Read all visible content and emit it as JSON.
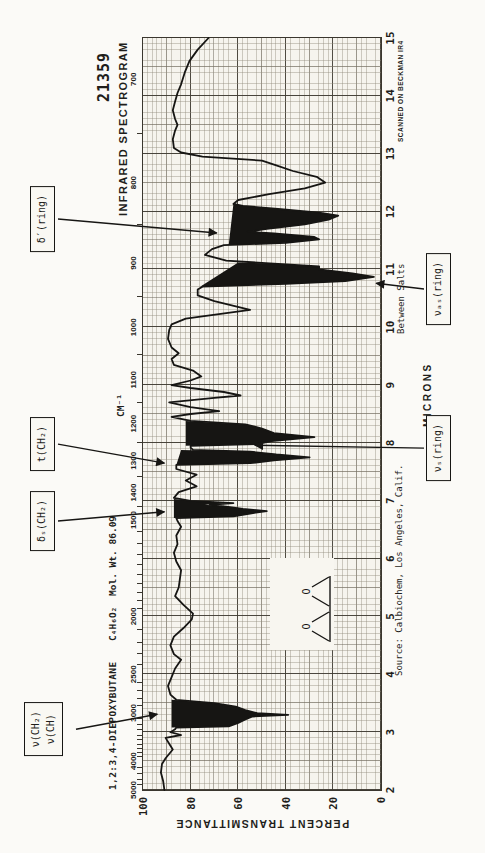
{
  "meta": {
    "catalog_number": "21359",
    "title": "INFRARED SPECTROGRAM",
    "compound": "1,2:3,4-DIEPOXYBUTANE",
    "formula": "C₄H₆O₂",
    "mol_wt": "Mol. Wt. 86.09",
    "source": "Source: Calbiochem, Los Angeles, Calif.",
    "sample_note": "Between Salts",
    "scanner": "SCANNED ON BECKMAN IR4"
  },
  "structure": {
    "o1": "O",
    "o2": "O"
  },
  "colors": {
    "paper": "#f6f4ee",
    "grid_minor": "#918b7c",
    "grid_major": "#3a362e",
    "ink": "#161513"
  },
  "chart_data": {
    "type": "line",
    "title": "INFRARED SPECTROGRAM",
    "xlabel_bottom": "MICRONS",
    "xlabel_top": "CM⁻¹",
    "ylabel": "PERCENT TRANSMITTANCE",
    "x_range_microns": [
      2,
      15
    ],
    "y_range_percent": [
      0,
      100
    ],
    "micron_ticks": [
      2,
      3,
      4,
      5,
      6,
      7,
      8,
      9,
      10,
      11,
      12,
      13,
      14,
      15
    ],
    "cm_ticks": [
      5000,
      4000,
      3000,
      2500,
      2000,
      1500,
      1400,
      1300,
      1200,
      1100,
      1000,
      900,
      800,
      700
    ],
    "cm_minor_ticks": [
      4800,
      4600,
      4400,
      4200,
      3900,
      3800,
      3700,
      3600,
      3500,
      3400,
      3300,
      3200,
      3100,
      2900,
      2800,
      2700,
      2600,
      2400,
      2300,
      2200,
      2100,
      1950,
      1900,
      1850,
      1800,
      1750,
      1700,
      1650,
      1600,
      1550,
      1450,
      1350,
      1250,
      1150,
      1050,
      950,
      850,
      750
    ],
    "t_ticks": [
      100,
      80,
      60,
      40,
      20,
      0
    ],
    "series": [
      [
        2.0,
        91
      ],
      [
        2.15,
        91.5
      ],
      [
        2.3,
        92.5
      ],
      [
        2.45,
        92
      ],
      [
        2.55,
        90.5
      ],
      [
        2.7,
        87.5
      ],
      [
        2.8,
        89
      ],
      [
        2.9,
        90.5
      ],
      [
        2.95,
        84
      ],
      [
        3.0,
        88.5
      ],
      [
        3.05,
        86.5
      ],
      [
        3.08,
        86
      ],
      [
        3.1,
        64
      ],
      [
        3.16,
        60
      ],
      [
        3.22,
        57
      ],
      [
        3.27,
        54
      ],
      [
        3.3,
        39
      ],
      [
        3.33,
        52
      ],
      [
        3.38,
        57
      ],
      [
        3.44,
        61
      ],
      [
        3.5,
        70
      ],
      [
        3.56,
        86
      ],
      [
        3.65,
        88.5
      ],
      [
        3.8,
        89.5
      ],
      [
        3.95,
        88
      ],
      [
        4.1,
        86.5
      ],
      [
        4.25,
        84
      ],
      [
        4.35,
        87
      ],
      [
        4.5,
        88.5
      ],
      [
        4.65,
        87
      ],
      [
        4.8,
        83
      ],
      [
        4.95,
        79.5
      ],
      [
        5.05,
        79
      ],
      [
        5.2,
        83
      ],
      [
        5.35,
        86.5
      ],
      [
        5.5,
        85
      ],
      [
        5.65,
        84.5
      ],
      [
        5.8,
        84
      ],
      [
        5.95,
        86
      ],
      [
        6.1,
        87
      ],
      [
        6.25,
        85.5
      ],
      [
        6.4,
        86
      ],
      [
        6.55,
        84
      ],
      [
        6.65,
        85.5
      ],
      [
        6.7,
        86
      ],
      [
        6.73,
        62
      ],
      [
        6.78,
        55
      ],
      [
        6.82,
        48
      ],
      [
        6.86,
        58
      ],
      [
        6.9,
        65
      ],
      [
        6.93,
        72
      ],
      [
        6.96,
        62
      ],
      [
        7.0,
        80
      ],
      [
        7.05,
        87
      ],
      [
        7.15,
        85
      ],
      [
        7.25,
        77.5
      ],
      [
        7.35,
        82
      ],
      [
        7.45,
        77.5
      ],
      [
        7.55,
        86
      ],
      [
        7.62,
        86
      ],
      [
        7.65,
        55
      ],
      [
        7.7,
        45
      ],
      [
        7.75,
        30
      ],
      [
        7.8,
        44
      ],
      [
        7.85,
        55
      ],
      [
        7.88,
        79
      ],
      [
        7.92,
        80
      ],
      [
        7.95,
        80
      ],
      [
        7.98,
        52
      ],
      [
        8.03,
        46
      ],
      [
        8.1,
        28
      ],
      [
        8.17,
        45
      ],
      [
        8.25,
        50
      ],
      [
        8.32,
        57
      ],
      [
        8.38,
        80
      ],
      [
        8.45,
        88
      ],
      [
        8.5,
        80
      ],
      [
        8.55,
        68
      ],
      [
        8.62,
        80
      ],
      [
        8.7,
        89
      ],
      [
        8.78,
        70
      ],
      [
        8.82,
        59
      ],
      [
        8.88,
        66
      ],
      [
        8.95,
        80
      ],
      [
        9.0,
        88
      ],
      [
        9.08,
        80
      ],
      [
        9.15,
        75.5
      ],
      [
        9.25,
        79
      ],
      [
        9.35,
        87
      ],
      [
        9.45,
        88
      ],
      [
        9.55,
        85
      ],
      [
        9.65,
        88
      ],
      [
        9.8,
        89.5
      ],
      [
        9.95,
        89
      ],
      [
        10.05,
        88
      ],
      [
        10.15,
        82
      ],
      [
        10.3,
        55
      ],
      [
        10.45,
        70
      ],
      [
        10.55,
        77
      ],
      [
        10.65,
        77
      ],
      [
        10.7,
        75
      ],
      [
        10.75,
        40
      ],
      [
        10.8,
        15
      ],
      [
        10.87,
        3
      ],
      [
        10.93,
        12
      ],
      [
        11.0,
        26
      ],
      [
        11.05,
        26
      ],
      [
        11.1,
        45
      ],
      [
        11.15,
        65
      ],
      [
        11.25,
        74
      ],
      [
        11.35,
        71
      ],
      [
        11.42,
        66
      ],
      [
        11.46,
        40
      ],
      [
        11.52,
        26
      ],
      [
        11.56,
        28
      ],
      [
        11.62,
        45
      ],
      [
        11.65,
        56
      ],
      [
        11.7,
        48
      ],
      [
        11.78,
        32
      ],
      [
        11.86,
        22
      ],
      [
        11.93,
        18
      ],
      [
        11.98,
        26
      ],
      [
        12.04,
        42
      ],
      [
        12.1,
        58
      ],
      [
        12.13,
        62
      ],
      [
        12.2,
        60
      ],
      [
        12.3,
        47
      ],
      [
        12.4,
        32
      ],
      [
        12.5,
        23.5
      ],
      [
        12.6,
        27
      ],
      [
        12.7,
        37
      ],
      [
        12.8,
        44
      ],
      [
        12.88,
        50
      ],
      [
        12.95,
        75
      ],
      [
        13.02,
        84
      ],
      [
        13.1,
        87
      ],
      [
        13.25,
        87.5
      ],
      [
        13.4,
        86.5
      ],
      [
        13.5,
        85.5
      ],
      [
        13.6,
        86.5
      ],
      [
        13.75,
        87.5
      ],
      [
        13.9,
        86.5
      ],
      [
        14.05,
        85.5
      ],
      [
        14.2,
        84
      ],
      [
        14.4,
        82.5
      ],
      [
        14.6,
        80.5
      ],
      [
        14.8,
        77
      ],
      [
        15.0,
        72.5
      ]
    ],
    "filled_bands": [
      [
        [
          3.08,
          88
        ],
        [
          3.1,
          64
        ],
        [
          3.16,
          60
        ],
        [
          3.22,
          57
        ],
        [
          3.27,
          54
        ],
        [
          3.3,
          39
        ],
        [
          3.33,
          52
        ],
        [
          3.38,
          57
        ],
        [
          3.44,
          61
        ],
        [
          3.5,
          70
        ],
        [
          3.56,
          88
        ]
      ],
      [
        [
          6.7,
          87
        ],
        [
          6.73,
          62
        ],
        [
          6.78,
          55
        ],
        [
          6.82,
          48
        ],
        [
          6.86,
          58
        ],
        [
          6.9,
          65
        ],
        [
          6.93,
          74
        ],
        [
          6.96,
          62
        ],
        [
          7.0,
          80
        ],
        [
          7.03,
          87
        ]
      ],
      [
        [
          7.62,
          86
        ],
        [
          7.65,
          55
        ],
        [
          7.7,
          45
        ],
        [
          7.75,
          30
        ],
        [
          7.8,
          44
        ],
        [
          7.85,
          55
        ],
        [
          7.88,
          84
        ]
      ],
      [
        [
          7.95,
          82
        ],
        [
          7.98,
          52
        ],
        [
          8.03,
          46
        ],
        [
          8.1,
          28
        ],
        [
          8.17,
          45
        ],
        [
          8.25,
          50
        ],
        [
          8.32,
          57
        ],
        [
          8.38,
          82
        ]
      ],
      [
        [
          10.7,
          76
        ],
        [
          10.75,
          40
        ],
        [
          10.8,
          15
        ],
        [
          10.87,
          3
        ],
        [
          10.93,
          12
        ],
        [
          11.0,
          26
        ],
        [
          11.05,
          26
        ],
        [
          11.1,
          45
        ],
        [
          11.12,
          60
        ]
      ],
      [
        [
          11.42,
          64
        ],
        [
          11.46,
          40
        ],
        [
          11.52,
          26
        ],
        [
          11.56,
          28
        ],
        [
          11.62,
          45
        ],
        [
          11.65,
          56
        ],
        [
          11.7,
          48
        ],
        [
          11.78,
          32
        ],
        [
          11.86,
          22
        ],
        [
          11.93,
          18
        ],
        [
          11.98,
          26
        ],
        [
          12.04,
          42
        ],
        [
          12.1,
          58
        ],
        [
          12.13,
          62
        ]
      ]
    ],
    "annotations": [
      {
        "lines": [
          "ν(CH₂)",
          "ν(CH)"
        ],
        "row": "top",
        "box_micron": 3.05,
        "target": {
          "micron": 3.31,
          "t": 94
        }
      },
      {
        "lines": [
          "δₛ(CH₂)"
        ],
        "row": "top",
        "box_micron": 6.65,
        "target": {
          "micron": 6.81,
          "t": 91
        }
      },
      {
        "lines": [
          "t(CH₂)"
        ],
        "row": "top",
        "box_micron": 7.98,
        "target": {
          "micron": 7.65,
          "t": 91
        }
      },
      {
        "lines": [
          "δ′(ring)"
        ],
        "row": "top",
        "box_micron": 11.87,
        "target": {
          "micron": 11.63,
          "t": 69
        }
      },
      {
        "lines": [
          "νₛ(ring)"
        ],
        "row": "bottom",
        "box_micron": 7.91,
        "target": {
          "micron": 7.96,
          "t": 53
        }
      },
      {
        "lines": [
          "νₐₛ(ring)"
        ],
        "row": "bottom",
        "box_micron": 10.66,
        "target": {
          "micron": 10.76,
          "t": 2
        }
      }
    ]
  }
}
